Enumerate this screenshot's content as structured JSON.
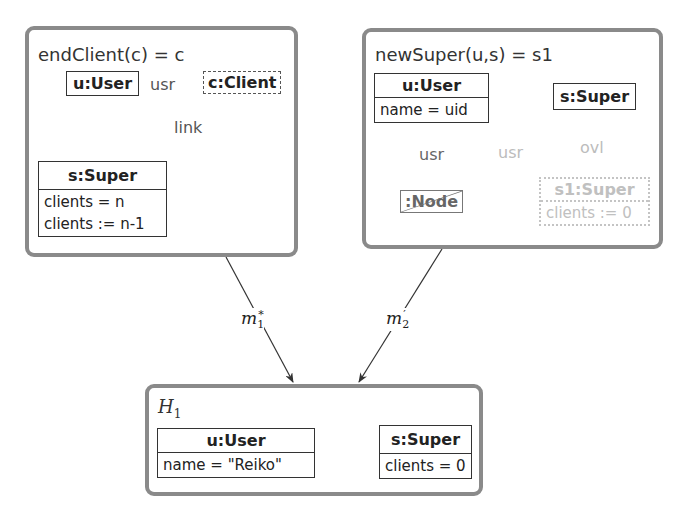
{
  "rules": [
    {
      "title": "endClient(c) = c",
      "objects": [
        {
          "name": "u:User",
          "attrs": []
        },
        {
          "name": "c:Client",
          "attrs": [],
          "style": "dashed"
        },
        {
          "name": "s:Super",
          "attrs": [
            "clients = n",
            "clients := n-1"
          ]
        }
      ],
      "edges": [
        {
          "from": "c:Client",
          "to": "u:User",
          "label": "usr",
          "style": "dashed"
        },
        {
          "from": "c:Client",
          "to": "s:Super",
          "label": "link",
          "style": "dashed"
        }
      ]
    },
    {
      "title": "newSuper(u,s) = s1",
      "objects": [
        {
          "name": "u:User",
          "attrs": [
            "name = uid"
          ]
        },
        {
          "name": "s:Super",
          "attrs": []
        },
        {
          "name": ":Node",
          "attrs": [],
          "style": "negated"
        },
        {
          "name": "s1:Super",
          "attrs": [
            "clients := 0"
          ],
          "style": "created"
        }
      ],
      "edges": [
        {
          "from": ":Node",
          "to": "u:User",
          "label": "usr",
          "style": "negated"
        },
        {
          "from": "s1:Super",
          "to": "u:User",
          "label": "usr",
          "style": "created"
        },
        {
          "from": "s:Super",
          "to": "s1:Super",
          "label": "ovl",
          "style": "created"
        }
      ]
    }
  ],
  "host": {
    "title": "H",
    "title_sub": "1",
    "objects": [
      {
        "name": "u:User",
        "attrs": [
          "name = \"Reiko\""
        ]
      },
      {
        "name": "s:Super",
        "attrs": [
          "clients = 0"
        ]
      }
    ]
  },
  "morphisms": [
    {
      "base": "m",
      "sub": "1",
      "sup": "*"
    },
    {
      "base": "m",
      "sub": "2",
      "sup": "′"
    }
  ],
  "colors": {
    "frame_border": "#8a8a8a",
    "object_border": "#333333",
    "created_element": "#c0c0c0",
    "edge_label": "#555555"
  }
}
